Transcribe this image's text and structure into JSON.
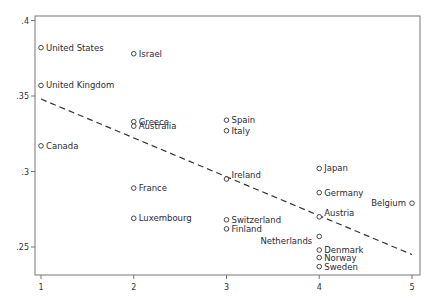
{
  "chart_data": {
    "type": "scatter",
    "title": "",
    "xlabel": "",
    "ylabel": "",
    "xlim": [
      0.95,
      5.08
    ],
    "ylim": [
      0.232,
      0.405
    ],
    "x_ticks": [
      1,
      2,
      3,
      4,
      5
    ],
    "x_tick_labels": [
      "1",
      "2",
      "3",
      "4",
      "5"
    ],
    "y_ticks": [
      0.25,
      0.3,
      0.35,
      0.4
    ],
    "y_tick_labels": [
      ".25",
      ".3",
      ".35",
      ".4"
    ],
    "grid": false,
    "legend": null,
    "points": [
      {
        "label": "United States",
        "x": 1,
        "y": 0.382,
        "align": "right"
      },
      {
        "label": "United Kingdom",
        "x": 1,
        "y": 0.357,
        "align": "right"
      },
      {
        "label": "Canada",
        "x": 1,
        "y": 0.317,
        "align": "right"
      },
      {
        "label": "Israel",
        "x": 2,
        "y": 0.378,
        "align": "right"
      },
      {
        "label": "Greece",
        "x": 2,
        "y": 0.333,
        "align": "right"
      },
      {
        "label": "Australia",
        "x": 2,
        "y": 0.33,
        "align": "right"
      },
      {
        "label": "France",
        "x": 2,
        "y": 0.289,
        "align": "right"
      },
      {
        "label": "Luxembourg",
        "x": 2,
        "y": 0.269,
        "align": "right"
      },
      {
        "label": "Spain",
        "x": 3,
        "y": 0.334,
        "align": "right"
      },
      {
        "label": "Italy",
        "x": 3,
        "y": 0.327,
        "align": "right"
      },
      {
        "label": "Ireland",
        "x": 3,
        "y": 0.295,
        "align": "right-up"
      },
      {
        "label": "Switzerland",
        "x": 3,
        "y": 0.268,
        "align": "right"
      },
      {
        "label": "Finland",
        "x": 3,
        "y": 0.262,
        "align": "right"
      },
      {
        "label": "Japan",
        "x": 4,
        "y": 0.302,
        "align": "right"
      },
      {
        "label": "Germany",
        "x": 4,
        "y": 0.286,
        "align": "right"
      },
      {
        "label": "Austria",
        "x": 4,
        "y": 0.27,
        "align": "right-up"
      },
      {
        "label": "Netherlands",
        "x": 4,
        "y": 0.257,
        "align": "left-down"
      },
      {
        "label": "Denmark",
        "x": 4,
        "y": 0.248,
        "align": "right"
      },
      {
        "label": "Norway",
        "x": 4,
        "y": 0.243,
        "align": "right"
      },
      {
        "label": "Sweden",
        "x": 4,
        "y": 0.237,
        "align": "right"
      },
      {
        "label": "Belgium",
        "x": 5,
        "y": 0.279,
        "align": "left"
      }
    ],
    "fit_line": {
      "style": "dashed",
      "x": [
        1,
        5
      ],
      "y": [
        0.348,
        0.245
      ]
    }
  },
  "colors": {
    "frame": "#555555",
    "marker": "#333333",
    "label": "#2a2a3a",
    "fit": "#333333"
  }
}
